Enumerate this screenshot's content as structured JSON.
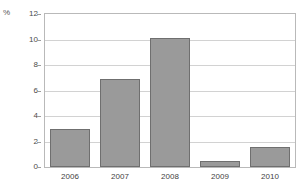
{
  "chart_data": {
    "type": "bar",
    "title": "",
    "xlabel": "",
    "ylabel": "%",
    "unit_label": "%",
    "categories": [
      "2006",
      "2007",
      "2008",
      "2009",
      "2010"
    ],
    "values": [
      3.0,
      6.9,
      10.1,
      0.45,
      1.6
    ],
    "ylim": [
      0,
      12
    ],
    "yticks": [
      0,
      2,
      4,
      6,
      8,
      10,
      12
    ],
    "ytick_labels": [
      "0",
      "2",
      "4",
      "6",
      "8",
      "10",
      "12"
    ],
    "grid": true,
    "legend": false,
    "series": [
      {
        "name": "",
        "values": [
          3.0,
          6.9,
          10.1,
          0.45,
          1.6
        ]
      }
    ],
    "colors": {
      "bar_fill": "#9a9a9a",
      "bar_border": "#6f6f6f",
      "gridline": "#d2d2d2",
      "frame": "#b9b9b9",
      "tick_label": "#4a4a4a",
      "category_label": "#3f3f3f",
      "background": "#ffffff"
    }
  }
}
